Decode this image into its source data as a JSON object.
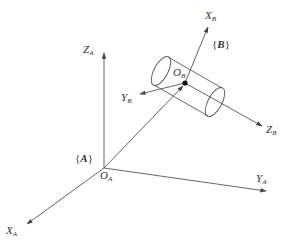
{
  "diagram": {
    "type": "coordinate-frame-transformation",
    "frame_A": {
      "label": "A",
      "frame_label_text": "{A}",
      "origin": {
        "name": "O",
        "sub": "A"
      },
      "axes": [
        {
          "name": "X",
          "sub": "A"
        },
        {
          "name": "Y",
          "sub": "A"
        },
        {
          "name": "Z",
          "sub": "A"
        }
      ]
    },
    "frame_B": {
      "label": "B",
      "frame_label_text": "{B}",
      "origin": {
        "name": "O",
        "sub": "B"
      },
      "axes": [
        {
          "name": "X",
          "sub": "B"
        },
        {
          "name": "Y",
          "sub": "B"
        },
        {
          "name": "Z",
          "sub": "B"
        }
      ]
    },
    "object": "cylinder",
    "line_color": "#555555",
    "background": "#ffffff"
  }
}
